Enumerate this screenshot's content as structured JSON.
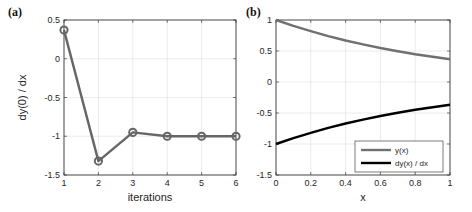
{
  "chart_data": [
    {
      "panel": "(a)",
      "type": "line",
      "title": "",
      "xlabel": "iterations",
      "ylabel": "dy(0) / dx",
      "xlim": [
        1,
        6
      ],
      "ylim": [
        -1.5,
        0.5
      ],
      "xticks": [
        "1",
        "2",
        "3",
        "4",
        "5",
        "6"
      ],
      "yticks": [
        "-1.5",
        "-1",
        "-0.5",
        "0",
        "0.5"
      ],
      "grid": true,
      "markers": "circle",
      "series": [
        {
          "name": "dy(0)/dx",
          "color": "#666666",
          "x": [
            1,
            2,
            3,
            4,
            5,
            6
          ],
          "values": [
            0.37,
            -1.32,
            -0.95,
            -1.0,
            -1.0,
            -1.0
          ]
        }
      ]
    },
    {
      "panel": "(b)",
      "type": "line",
      "title": "",
      "xlabel": "x",
      "ylabel": "",
      "xlim": [
        0,
        1
      ],
      "ylim": [
        -1.5,
        1
      ],
      "xticks": [
        "0",
        "0.2",
        "0.4",
        "0.6",
        "0.8",
        "1"
      ],
      "yticks": [
        "-1.5",
        "-1",
        "-0.5",
        "0",
        "0.5",
        "1"
      ],
      "grid": true,
      "legend_position": "lower right",
      "x": [
        0,
        0.1,
        0.2,
        0.3,
        0.4,
        0.5,
        0.6,
        0.7,
        0.8,
        0.9,
        1.0
      ],
      "series": [
        {
          "name": "y(x)",
          "color": "#707070",
          "values": [
            1.0,
            0.905,
            0.819,
            0.741,
            0.67,
            0.607,
            0.549,
            0.497,
            0.449,
            0.407,
            0.368
          ]
        },
        {
          "name": "dy(x) / dx",
          "color": "#000000",
          "values": [
            -1.0,
            -0.905,
            -0.819,
            -0.741,
            -0.67,
            -0.607,
            -0.549,
            -0.497,
            -0.449,
            -0.407,
            -0.368
          ]
        }
      ]
    }
  ]
}
